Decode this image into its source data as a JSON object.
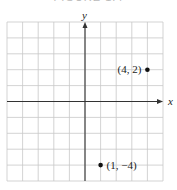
{
  "chart_data": {
    "type": "scatter",
    "title": "FIGURE 1.4",
    "xlabel": "x",
    "ylabel": "y",
    "xlim": [
      -5,
      5
    ],
    "ylim": [
      -5,
      5
    ],
    "grid": true,
    "grid_step": 1,
    "points": [
      {
        "x": 4,
        "y": 2,
        "label": "(4, 2)",
        "label_position": "left"
      },
      {
        "x": 1,
        "y": -4,
        "label": "(1, −4)",
        "label_position": "right"
      }
    ]
  },
  "colors": {
    "grid": "#c8c8c8",
    "axis": "#333333",
    "point": "#111111"
  }
}
